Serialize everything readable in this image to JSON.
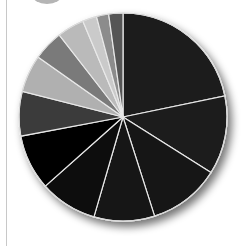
{
  "chart_data": {
    "type": "pie",
    "title": "",
    "legend": [],
    "start_angle_deg": 0,
    "direction": "clockwise",
    "slices": [
      {
        "label": "",
        "value": 21.7,
        "color": "#1c1c1c"
      },
      {
        "label": "",
        "value": 12.2,
        "color": "#1a1a1a"
      },
      {
        "label": "",
        "value": 11.1,
        "color": "#151515"
      },
      {
        "label": "",
        "value": 9.4,
        "color": "#121212"
      },
      {
        "label": "",
        "value": 8.9,
        "color": "#0e0e0e"
      },
      {
        "label": "",
        "value": 8.6,
        "color": "#040404"
      },
      {
        "label": "",
        "value": 6.9,
        "color": "#3b3b3b"
      },
      {
        "label": "",
        "value": 5.8,
        "color": "#b0b0b0"
      },
      {
        "label": "",
        "value": 4.7,
        "color": "#7a7a7a"
      },
      {
        "label": "",
        "value": 4.2,
        "color": "#bababa"
      },
      {
        "label": "",
        "value": 2.2,
        "color": "#cacaca"
      },
      {
        "label": "",
        "value": 1.9,
        "color": "#8c8c8c"
      },
      {
        "label": "",
        "value": 2.2,
        "color": "#555555"
      }
    ],
    "separator_color": "#e8e8e8",
    "center": [
      123,
      117
    ],
    "radius": 104
  }
}
